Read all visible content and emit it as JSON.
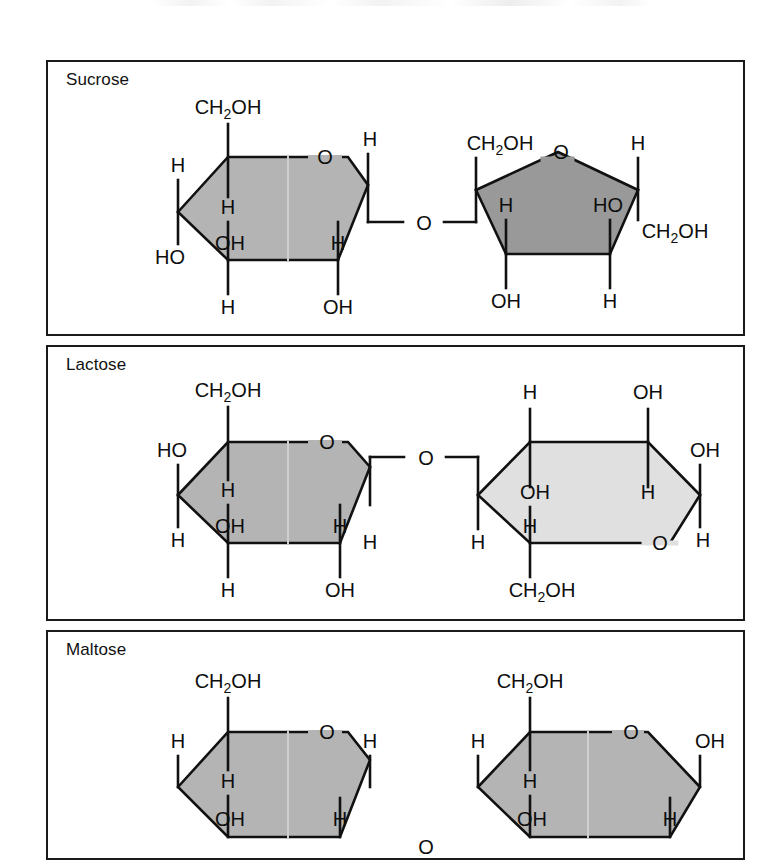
{
  "figure": {
    "type": "chemical-structure-diagram",
    "panel_count": 3,
    "colors": {
      "border": "#1a1a1a",
      "background": "#ffffff",
      "ring_medium_gray": "#b4b4b4",
      "ring_dark_gray": "#999999",
      "ring_light_gray": "#e0e0e0",
      "bond_stroke": "#111111",
      "text": "#0d0d0d"
    }
  },
  "panels": [
    {
      "id": "sucrose",
      "title": "Sucrose",
      "linkage_label": "O",
      "rings": [
        {
          "name": "glucose",
          "shape": "hexagon",
          "fill": "#b4b4b4",
          "ring_oxygen": "O",
          "substituents": {
            "c6_up": "CH2OH",
            "c6_up_main": "CH",
            "c6_up_sub": "2",
            "c6_up_tail": "OH",
            "upper_left_outer": "H",
            "lower_left_outer": "HO",
            "c2_inner_up": "H",
            "c2_inner_down": "OH",
            "c1_bottom": "H",
            "c4_bottom": "OH",
            "right_upper": "H",
            "right_inner": "H"
          }
        },
        {
          "name": "fructose",
          "shape": "pentagon",
          "fill": "#999999",
          "ring_oxygen": "O",
          "substituents": {
            "left_top": "CH2OH",
            "left_top_main": "CH",
            "left_top_sub": "2",
            "left_top_tail": "OH",
            "right_top": "H",
            "right_bottom": "CH2OH",
            "right_bottom_main": "CH",
            "right_bottom_sub": "2",
            "right_bottom_tail": "OH",
            "inner_left": "H",
            "inner_right": "HO",
            "bottom_left": "OH",
            "bottom_right": "H"
          }
        }
      ]
    },
    {
      "id": "lactose",
      "title": "Lactose",
      "linkage_label": "O",
      "rings": [
        {
          "name": "galactose-left",
          "shape": "hexagon",
          "fill": "#b4b4b4",
          "ring_oxygen": "O",
          "substituents": {
            "c6_up": "CH2OH",
            "c6_up_main": "CH",
            "c6_up_sub": "2",
            "c6_up_tail": "OH",
            "upper_left_outer": "HO",
            "lower_left_outer": "H",
            "c2_inner_up": "H",
            "c2_inner_down": "OH",
            "c1_bottom": "H",
            "c4_bottom": "OH",
            "right_inner": "H",
            "right_lower": "H"
          }
        },
        {
          "name": "glucose-right",
          "shape": "hexagon-flipped",
          "fill": "#e0e0e0",
          "ring_oxygen": "O",
          "substituents": {
            "top_left": "H",
            "top_right": "OH",
            "inner_top_left": "OH",
            "inner_top_right": "H",
            "inner_lower_left": "H",
            "left_outer_lower": "H",
            "right_upper": "OH",
            "right_lower": "H",
            "bottom": "CH2OH",
            "bottom_main": "CH",
            "bottom_sub": "2",
            "bottom_tail": "OH"
          }
        }
      ]
    },
    {
      "id": "maltose",
      "title": "Maltose",
      "linkage_label": "O",
      "clipped": true,
      "rings": [
        {
          "name": "glucose-left",
          "shape": "hexagon",
          "fill": "#b4b4b4",
          "ring_oxygen": "O",
          "substituents": {
            "c6_up": "CH2OH",
            "c6_up_main": "CH",
            "c6_up_sub": "2",
            "c6_up_tail": "OH",
            "upper_left_outer": "H",
            "c2_inner_up": "H",
            "c2_inner_down": "OH",
            "right_upper": "H",
            "right_inner": "H"
          }
        },
        {
          "name": "glucose-right",
          "shape": "hexagon",
          "fill": "#b4b4b4",
          "ring_oxygen": "O",
          "substituents": {
            "c6_up": "CH2OH",
            "c6_up_main": "CH",
            "c6_up_sub": "2",
            "c6_up_tail": "OH",
            "upper_left_outer": "H",
            "c2_inner_up": "H",
            "c2_inner_down": "OH",
            "right_upper": "OH",
            "right_inner": "H"
          }
        }
      ]
    }
  ]
}
